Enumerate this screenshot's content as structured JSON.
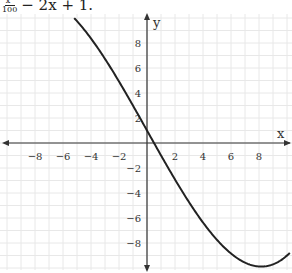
{
  "caption": {
    "fraction_numerator": "x³",
    "fraction_denominator": "100",
    "rest": "− 2x + 1."
  },
  "colors": {
    "grid": "#e8e8e8",
    "axis": "#333333",
    "curve": "#222222"
  },
  "chart_data": {
    "type": "line",
    "function": "f(x) = x^3/100 - 2x + 1",
    "xlabel": "x",
    "ylabel": "y",
    "xlim": [
      -10.5,
      10.3
    ],
    "ylim": [
      -10.5,
      10.2
    ],
    "x_ticks": [
      -8,
      -6,
      -4,
      -2,
      2,
      4,
      6,
      8
    ],
    "y_ticks": [
      -8,
      -6,
      -4,
      -2,
      2,
      4,
      6,
      8
    ],
    "grid": true,
    "grid_step": 1,
    "series": [
      {
        "name": "f(x)",
        "x": [
          -5.2,
          -4,
          -3,
          -2,
          -1,
          0,
          1,
          2,
          3,
          4,
          5,
          6,
          7,
          8,
          9,
          10.2
        ],
        "values": [
          9.99,
          8.36,
          6.73,
          4.92,
          2.99,
          1,
          -0.99,
          -2.92,
          -4.73,
          -6.36,
          -7.75,
          -8.84,
          -9.57,
          -9.88,
          -9.71,
          -8.79
        ]
      }
    ]
  }
}
